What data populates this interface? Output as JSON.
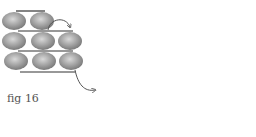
{
  "figure": {
    "caption": "fig 16",
    "left_panel": {
      "rows": [
        2,
        3,
        3
      ],
      "arrows": [
        "loop-over-top-right",
        "exit-bottom-right"
      ]
    },
    "right_panel": {
      "rows": [
        2,
        3,
        3
      ],
      "extra_beads": 2,
      "arrows": [
        "thread-up-exit-top-right",
        "rotate-bottom-bead"
      ]
    },
    "colors": {
      "bead": "#8f8f8f",
      "bead_highlight": "#d8d8d8",
      "thread": "#333333",
      "arrow": "#555555"
    }
  }
}
